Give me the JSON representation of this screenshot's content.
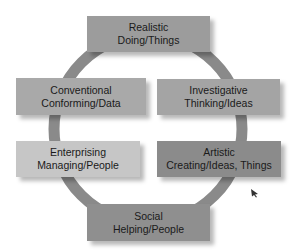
{
  "diagram": {
    "title": "",
    "nodes": [
      {
        "id": "realistic",
        "type": "Realistic",
        "focus": "Doing/Things",
        "fill": "#9c9c9c"
      },
      {
        "id": "investigative",
        "type": "Investigative",
        "focus": "Thinking/Ideas",
        "fill": "#a4a4a4"
      },
      {
        "id": "artistic",
        "type": "Artistic",
        "focus": "Creating/Ideas, Things",
        "fill": "#8b8b8b"
      },
      {
        "id": "social",
        "type": "Social",
        "focus": "Helping/People",
        "fill": "#8f8f8f"
      },
      {
        "id": "enterprising",
        "type": "Enterprising",
        "focus": "Managing/People",
        "fill": "#c6c6c6"
      },
      {
        "id": "conventional",
        "type": "Conventional",
        "focus": "Conforming/Data",
        "fill": "#a9a9a9"
      }
    ],
    "connector": {
      "shape": "circle",
      "color": "#8a8a8a",
      "order": [
        "realistic",
        "investigative",
        "artistic",
        "social",
        "enterprising",
        "conventional"
      ]
    }
  }
}
